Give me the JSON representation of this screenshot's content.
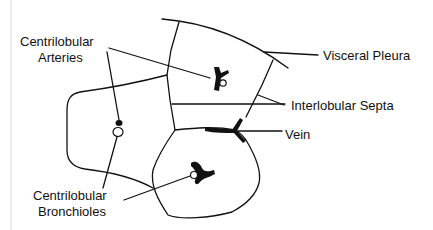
{
  "diagram": {
    "labels": {
      "arteries_line1": "Centrilobular",
      "arteries_line2": "Arteries",
      "pleura": "Visceral Pleura",
      "septa": "Interlobular Septa",
      "vein": "Vein",
      "bronchioles_line1": "Centrilobular",
      "bronchioles_line2": "Bronchioles"
    },
    "structures": [
      {
        "name": "visceral-pleura",
        "type": "curve"
      },
      {
        "name": "upper-lobule",
        "type": "polygon"
      },
      {
        "name": "left-lobule",
        "type": "polygon"
      },
      {
        "name": "lower-lobule",
        "type": "polygon"
      },
      {
        "name": "centrilobular-artery",
        "count": 3
      },
      {
        "name": "centrilobular-bronchiole",
        "count": 3
      },
      {
        "name": "vein",
        "count": 1
      }
    ],
    "colors": {
      "ink": "#111111",
      "background": "#ffffff"
    }
  }
}
